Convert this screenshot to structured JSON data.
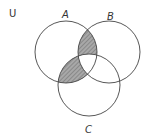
{
  "diagram": {
    "type": "venn",
    "universe_label": "U",
    "sets": [
      {
        "name": "A",
        "cx": 66,
        "cy": 52,
        "r": 31,
        "label_x": 63,
        "label_y": 18
      },
      {
        "name": "B",
        "cx": 109,
        "cy": 52,
        "r": 31,
        "label_x": 109,
        "label_y": 20
      },
      {
        "name": "C",
        "cx": 89,
        "cy": 85,
        "r": 31,
        "label_x": 86,
        "label_y": 134
      }
    ],
    "shaded_regions": [
      "A∩B∩C'",
      "A∩C∩B'"
    ],
    "colors": {
      "stroke": "#444444",
      "shade": "#999999",
      "hatch": "#666666",
      "background": "#ffffff"
    }
  }
}
